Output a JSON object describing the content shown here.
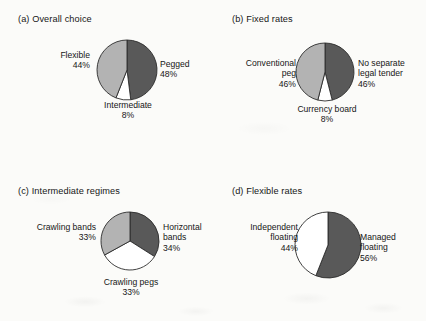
{
  "figure": {
    "background_color": "#fbfbf9",
    "text_color": "#161616"
  },
  "palette": {
    "dark": "#595959",
    "light": "#b3b3b3",
    "white": "#ffffff",
    "outline": "#2b2b2b"
  },
  "chart_data": [
    {
      "type": "pie",
      "id": "overall-choice",
      "title": "(a) Overall choice",
      "start_angle": 0,
      "direction": "clockwise",
      "categories": [
        "Pegged",
        "Intermediate",
        "Flexible"
      ],
      "values": [
        48,
        8,
        44
      ],
      "value_labels": [
        "48%",
        "8%",
        "44%"
      ],
      "colors": [
        "#595959",
        "#ffffff",
        "#b3b3b3"
      ],
      "legend": "none",
      "labels": [
        {
          "name": "Pegged",
          "value": "48%",
          "align": "left"
        },
        {
          "name": "Intermediate",
          "value": "8%",
          "align": "center"
        },
        {
          "name": "Flexible",
          "value": "44%",
          "align": "right"
        }
      ]
    },
    {
      "type": "pie",
      "id": "fixed-rates",
      "title": "(b) Fixed rates",
      "start_angle": 0,
      "direction": "clockwise",
      "categories": [
        "No separate legal tender",
        "Currency board",
        "Conventional peg"
      ],
      "values": [
        46,
        8,
        46
      ],
      "value_labels": [
        "46%",
        "8%",
        "46%"
      ],
      "colors": [
        "#595959",
        "#ffffff",
        "#b3b3b3"
      ],
      "legend": "none",
      "labels": [
        {
          "name": "No separate",
          "name2": "legal tender",
          "value": "46%",
          "align": "left"
        },
        {
          "name": "Currency board",
          "value": "8%",
          "align": "center"
        },
        {
          "name": "Conventional",
          "name2": "peg",
          "value": "46%",
          "align": "right"
        }
      ]
    },
    {
      "type": "pie",
      "id": "intermediate-regimes",
      "title": "(c) Intermediate regimes",
      "start_angle": 0,
      "direction": "clockwise",
      "categories": [
        "Horizontal bands",
        "Crawling pegs",
        "Crawling bands"
      ],
      "values": [
        34,
        33,
        33
      ],
      "value_labels": [
        "34%",
        "33%",
        "33%"
      ],
      "colors": [
        "#595959",
        "#ffffff",
        "#b3b3b3"
      ],
      "legend": "none",
      "labels": [
        {
          "name": "Horizontal",
          "name2": "bands",
          "value": "34%",
          "align": "left"
        },
        {
          "name": "Crawling pegs",
          "value": "33%",
          "align": "center"
        },
        {
          "name": "Crawling bands",
          "value": "33%",
          "align": "right"
        }
      ]
    },
    {
      "type": "pie",
      "id": "flexible-rates",
      "title": "(d) Flexible rates",
      "start_angle": 0,
      "direction": "clockwise",
      "categories": [
        "Managed floating",
        "Independent floating"
      ],
      "values": [
        56,
        44
      ],
      "value_labels": [
        "56%",
        "44%"
      ],
      "colors": [
        "#595959",
        "#ffffff"
      ],
      "legend": "none",
      "labels": [
        {
          "name": "Managed",
          "name2": "floating",
          "value": "56%",
          "align": "left"
        },
        {
          "name": "Independent",
          "name2": "floating",
          "value": "44%",
          "align": "right"
        }
      ]
    }
  ],
  "layout": {
    "panels": [
      {
        "title_x": 18,
        "title_y": 14,
        "pie_cx": 127,
        "pie_cy": 70,
        "pie_r": 30,
        "label_positions": [
          {
            "x": 160,
            "y": 59,
            "w": 60
          },
          {
            "x": 92,
            "y": 100,
            "w": 72
          },
          {
            "x": 30,
            "y": 50,
            "w": 60
          }
        ]
      },
      {
        "title_x": 232,
        "title_y": 14,
        "pie_cx": 325,
        "pie_cy": 72,
        "pie_r": 29,
        "label_positions": [
          {
            "x": 358,
            "y": 58,
            "w": 66
          },
          {
            "x": 292,
            "y": 104,
            "w": 70
          },
          {
            "x": 234,
            "y": 58,
            "w": 62
          }
        ]
      },
      {
        "title_x": 18,
        "title_y": 186,
        "pie_cx": 130,
        "pie_cy": 241,
        "pie_r": 29,
        "label_positions": [
          {
            "x": 163,
            "y": 222,
            "w": 56
          },
          {
            "x": 92,
            "y": 277,
            "w": 78
          },
          {
            "x": 22,
            "y": 222,
            "w": 74
          }
        ]
      },
      {
        "title_x": 232,
        "title_y": 186,
        "pie_cx": 328,
        "pie_cy": 245,
        "pie_r": 33,
        "label_positions": [
          {
            "x": 360,
            "y": 232,
            "w": 60
          },
          {
            "x": 234,
            "y": 222,
            "w": 64
          }
        ]
      }
    ]
  }
}
